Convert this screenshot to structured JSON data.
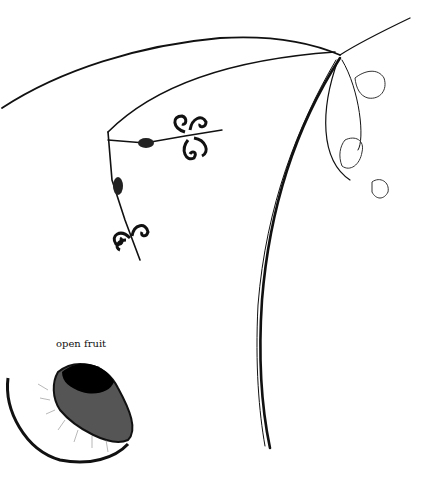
{
  "figure": {
    "label": "open fruit",
    "ink_color": "#111111",
    "background_color": "#ffffff"
  }
}
